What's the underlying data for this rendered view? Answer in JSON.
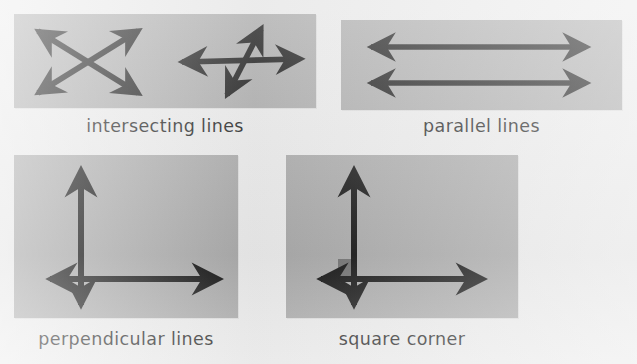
{
  "page": {
    "background_color": "#eaeaea",
    "panel_color": "#a9a9a9",
    "ink_color": "#101010",
    "corner_marker_color": "#6f6f6f",
    "width": 637,
    "height": 364
  },
  "figures": [
    {
      "id": "intersecting",
      "caption": "intersecting lines",
      "panel": {
        "x": 14,
        "y": 14,
        "width": 302,
        "height": 94
      },
      "description": "Two separate diagrams of crossing double-headed arrows",
      "diagrams": [
        {
          "name": "x-cross",
          "arrows": [
            {
              "name": "diagonal-down-right-arrow",
              "x1": 22,
              "y1": 16,
              "x2": 126,
              "y2": 80,
              "heads": "both"
            },
            {
              "name": "diagonal-up-right-arrow",
              "x1": 22,
              "y1": 80,
              "x2": 126,
              "y2": 16,
              "heads": "both"
            }
          ]
        },
        {
          "name": "steep-cross",
          "arrows": [
            {
              "name": "horizontal-arrow",
              "x1": 166,
              "y1": 48,
              "x2": 288,
              "y2": 44,
              "heads": "both"
            },
            {
              "name": "steep-diagonal-arrow",
              "x1": 212,
              "y1": 82,
              "x2": 248,
              "y2": 14,
              "heads": "both"
            }
          ]
        }
      ]
    },
    {
      "id": "parallel",
      "caption": "parallel lines",
      "panel": {
        "x": 341,
        "y": 20,
        "width": 281,
        "height": 90
      },
      "description": "Two horizontal double-headed arrows that never meet",
      "diagrams": [
        {
          "name": "parallel-pair",
          "arrows": [
            {
              "name": "upper-horizontal-arrow",
              "x1": 26,
              "y1": 27,
              "x2": 248,
              "y2": 27,
              "heads": "both"
            },
            {
              "name": "lower-horizontal-arrow",
              "x1": 26,
              "y1": 63,
              "x2": 248,
              "y2": 63,
              "heads": "both"
            }
          ]
        }
      ]
    },
    {
      "id": "perpendicular",
      "caption": "perpendicular lines",
      "panel": {
        "x": 14,
        "y": 155,
        "width": 224,
        "height": 163
      },
      "description": "A vertical and a horizontal double-headed arrow crossing at right angles",
      "diagrams": [
        {
          "name": "right-angle-cross",
          "arrows": [
            {
              "name": "vertical-arrow",
              "x1": 67,
              "y1": 152,
              "x2": 67,
              "y2": 14,
              "heads": "both"
            },
            {
              "name": "horizontal-arrow",
              "x1": 34,
              "y1": 124,
              "x2": 206,
              "y2": 124,
              "heads": "both"
            }
          ]
        }
      ]
    },
    {
      "id": "square-corner",
      "caption": "square corner",
      "panel": {
        "x": 286,
        "y": 155,
        "width": 232,
        "height": 163
      },
      "description": "Perpendicular arrows with a small shaded square marking the right angle",
      "diagrams": [
        {
          "name": "right-angle-cross-with-marker",
          "arrows": [
            {
              "name": "vertical-arrow",
              "x1": 68,
              "y1": 152,
              "x2": 68,
              "y2": 14,
              "heads": "both"
            },
            {
              "name": "horizontal-arrow",
              "x1": 33,
              "y1": 124,
              "x2": 198,
              "y2": 124,
              "heads": "both"
            }
          ],
          "marker": {
            "name": "right-angle-square",
            "x": 52,
            "y": 104,
            "width": 17,
            "height": 17,
            "color": "#6f6f6f"
          }
        }
      ]
    }
  ]
}
